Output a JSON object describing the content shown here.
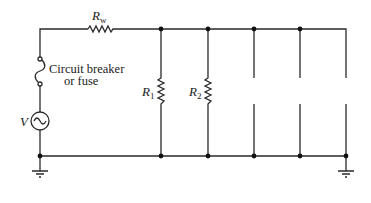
{
  "diagram": {
    "type": "parallel circuit schematic",
    "labels": {
      "rw_main": "R",
      "rw_sub": "w",
      "r1_main": "R",
      "r1_sub": "1",
      "r2_main": "R",
      "r2_sub": "2",
      "fuse_line1": "Circuit breaker",
      "fuse_line2": "or fuse",
      "source": "V"
    },
    "components": [
      {
        "id": "source",
        "kind": "ac-voltage-source",
        "label": "V"
      },
      {
        "id": "fuse",
        "kind": "circuit-breaker-or-fuse",
        "label": "Circuit breaker or fuse"
      },
      {
        "id": "Rw",
        "kind": "resistor",
        "label": "Rw"
      },
      {
        "id": "R1",
        "kind": "resistor",
        "label": "R1"
      },
      {
        "id": "R2",
        "kind": "resistor",
        "label": "R2"
      },
      {
        "id": "open3",
        "kind": "open-branch"
      },
      {
        "id": "open4",
        "kind": "open-branch"
      },
      {
        "id": "open5",
        "kind": "open-branch"
      },
      {
        "id": "gnd_left",
        "kind": "ground"
      },
      {
        "id": "gnd_right",
        "kind": "ground"
      }
    ]
  }
}
